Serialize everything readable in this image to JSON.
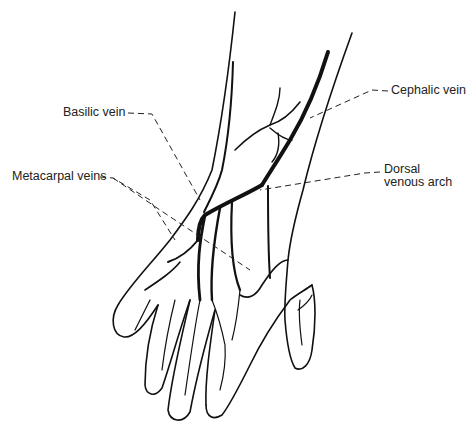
{
  "diagram": {
    "labels": [
      {
        "id": "basilic",
        "text": "Basilic vein"
      },
      {
        "id": "metacarpal",
        "text": "Metacarpal veins"
      },
      {
        "id": "cephalic",
        "text": "Cephalic vein"
      },
      {
        "id": "dorsal_line1",
        "text": "Dorsal"
      },
      {
        "id": "dorsal_line2",
        "text": "venous arch"
      }
    ],
    "colors": {
      "ink": "#111111",
      "background": "#ffffff"
    }
  }
}
